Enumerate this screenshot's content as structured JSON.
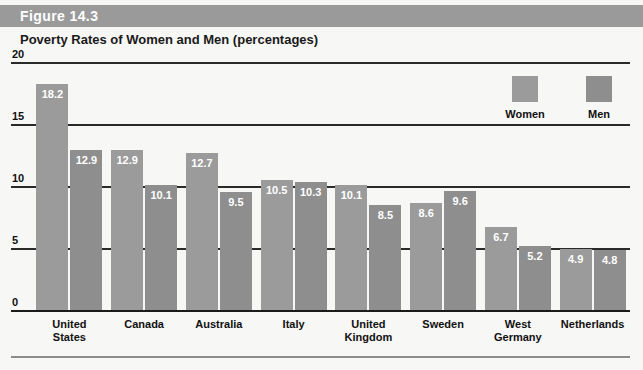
{
  "header": {
    "figure_label": "Figure 14.3",
    "band_color": "#9a9a9a"
  },
  "subtitle": "Poverty Rates of Women and Men (percentages)",
  "legend": {
    "women_label": "Women",
    "men_label": "Men",
    "women_color": "#9b9b9b",
    "men_color": "#8e8e8e"
  },
  "axis": {
    "ticks": [
      "0",
      "5",
      "10",
      "15",
      "20"
    ]
  },
  "chart_data": {
    "type": "bar",
    "title": "Poverty Rates of Women and Men (percentages)",
    "xlabel": "",
    "ylabel": "",
    "ylim": [
      0,
      20
    ],
    "yticks": [
      0,
      5,
      10,
      15,
      20
    ],
    "grid": true,
    "legend_position": "top-right",
    "categories": [
      "United States",
      "Canada",
      "Australia",
      "Italy",
      "United Kingdom",
      "Sweden",
      "West Germany",
      "Netherlands"
    ],
    "category_lines": [
      [
        "United",
        "States"
      ],
      [
        "Canada"
      ],
      [
        "Australia"
      ],
      [
        "Italy"
      ],
      [
        "United",
        "Kingdom"
      ],
      [
        "Sweden"
      ],
      [
        "West",
        "Germany"
      ],
      [
        "Netherlands"
      ]
    ],
    "series": [
      {
        "name": "Women",
        "color": "#9b9b9b",
        "values": [
          18.2,
          12.9,
          12.7,
          10.5,
          10.1,
          8.6,
          6.7,
          4.9
        ]
      },
      {
        "name": "Men",
        "color": "#8e8e8e",
        "values": [
          12.9,
          10.1,
          9.5,
          10.3,
          8.5,
          9.6,
          5.2,
          4.8
        ]
      }
    ],
    "value_labels": [
      [
        "18.2",
        "12.9"
      ],
      [
        "12.9",
        "10.1"
      ],
      [
        "12.7",
        "9.5"
      ],
      [
        "10.5",
        "10.3"
      ],
      [
        "10.1",
        "8.5"
      ],
      [
        "8.6",
        "9.6"
      ],
      [
        "6.7",
        "5.2"
      ],
      [
        "4.9",
        "4.8"
      ]
    ]
  }
}
